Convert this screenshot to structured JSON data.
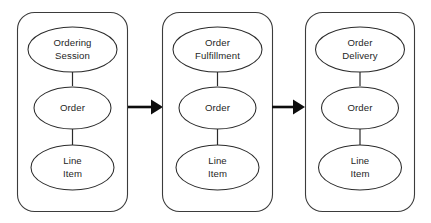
{
  "diagram": {
    "type": "flow-diagram",
    "background_color": "#ffffff",
    "stroke_color": "#2b2b2b",
    "container_stroke_color": "#3b3b3b",
    "arrow_color": "#0d0d0d",
    "text_color": "#262626",
    "phases": [
      {
        "id": "phase-1",
        "nodes": [
          {
            "id": "phase-1-node-1",
            "lines": [
              "Ordering",
              "Session"
            ]
          },
          {
            "id": "phase-1-node-2",
            "lines": [
              "Order"
            ]
          },
          {
            "id": "phase-1-node-3",
            "lines": [
              "Line",
              "Item"
            ]
          }
        ]
      },
      {
        "id": "phase-2",
        "nodes": [
          {
            "id": "phase-2-node-1",
            "lines": [
              "Order",
              "Fulfillment"
            ]
          },
          {
            "id": "phase-2-node-2",
            "lines": [
              "Order"
            ]
          },
          {
            "id": "phase-2-node-3",
            "lines": [
              "Line",
              "Item"
            ]
          }
        ]
      },
      {
        "id": "phase-3",
        "nodes": [
          {
            "id": "phase-3-node-1",
            "lines": [
              "Order",
              "Delivery"
            ]
          },
          {
            "id": "phase-3-node-2",
            "lines": [
              "Order"
            ]
          },
          {
            "id": "phase-3-node-3",
            "lines": [
              "Line",
              "Item"
            ]
          }
        ]
      }
    ],
    "connectors": [
      {
        "id": "arrow-1",
        "from": "phase-1",
        "to": "phase-2",
        "style": "solid-filled-arrowhead"
      },
      {
        "id": "arrow-2",
        "from": "phase-2",
        "to": "phase-3",
        "style": "solid-filled-arrowhead"
      }
    ]
  }
}
